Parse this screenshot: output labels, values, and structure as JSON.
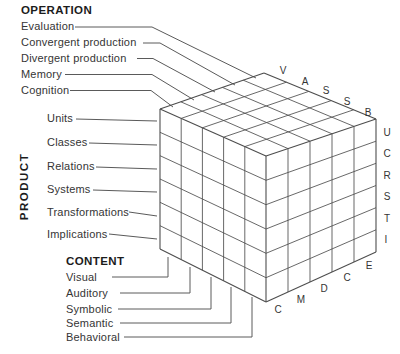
{
  "operation": {
    "header": "OPERATION",
    "items": [
      "Evaluation",
      "Convergent production",
      "Divergent production",
      "Memory",
      "Cognition"
    ]
  },
  "product": {
    "header": "PRODUCT",
    "items": [
      "Units",
      "Classes",
      "Relations",
      "Systems",
      "Transformations",
      "Implications"
    ]
  },
  "content": {
    "header": "CONTENT",
    "items": [
      "Visual",
      "Auditory",
      "Symbolic",
      "Semantic",
      "Behavioral"
    ]
  },
  "cube": {
    "top_edge_letters": [
      "V",
      "A",
      "S",
      "S",
      "B"
    ],
    "right_edge_letters": [
      "U",
      "C",
      "R",
      "S",
      "T",
      "I"
    ],
    "bottom_edge_letters": [
      "C",
      "M",
      "D",
      "C",
      "E"
    ]
  },
  "colors": {
    "line": "#4d4d4d",
    "text": "#353535"
  }
}
